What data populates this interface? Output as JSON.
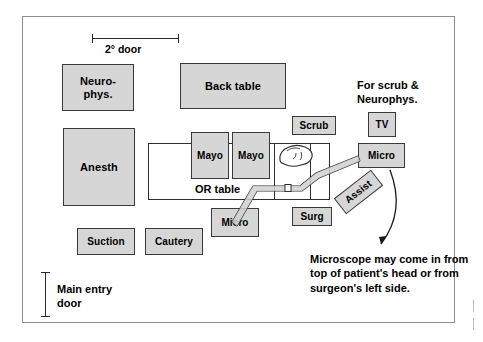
{
  "diagram": {
    "colors": {
      "equipment_fill": "#d6d6d6",
      "equipment_border": "#3a3a3a",
      "room_border": "#8e8e8e",
      "line": "#2e2e2e",
      "text": "#000000"
    }
  },
  "dimensions": {
    "secondary_door": "2° door",
    "main_door_line1": "Main entry",
    "main_door_line2": "door",
    "main_door_full": "Main entry\ndoor"
  },
  "equipment": {
    "neurophys_line1": "Neuro-",
    "neurophys_line2": "phys.",
    "back_table": "Back table",
    "anesth": "Anesth",
    "mayo_left": "Mayo",
    "mayo_right": "Mayo",
    "or_table": "OR table",
    "scrub": "Scrub",
    "tv": "TV",
    "micro_right": "Micro",
    "micro_lower": "Micro",
    "surg": "Surg",
    "assist": "Assist",
    "suction": "Suction",
    "cautery": "Cautery"
  },
  "notes": {
    "tv_note_line1": "For scrub &",
    "tv_note_line2": "Neurophys.",
    "tv_note_full": "For scrub &\nNeurophys.",
    "microscope_note_line1": "Microscope may come in from",
    "microscope_note_line2": "top of patient's head or from",
    "microscope_note_line3": "surgeon's left side.",
    "microscope_note_full": "Microscope may come in from\ntop of patient's head or from\nsurgeon's left side."
  },
  "icons": {
    "patient_head": "patient-head-sketch",
    "microscope_boom": "microscope-boom-arm",
    "callout_arrow": "curved-callout-arrow"
  }
}
